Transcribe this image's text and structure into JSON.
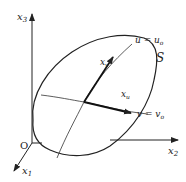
{
  "figure": {
    "type": "surface-parameter-curves",
    "axes": {
      "x1": {
        "label": "x",
        "sub": "1"
      },
      "x2": {
        "label": "x",
        "sub": "2"
      },
      "x3": {
        "label": "x",
        "sub": "3"
      },
      "origin": "O"
    },
    "surface": {
      "label": "S"
    },
    "curves": {
      "u_curve": {
        "label": "u = u",
        "sub": "o"
      },
      "v_curve": {
        "label": "v = v",
        "sub": "o"
      }
    },
    "vectors": {
      "xu": {
        "label": "x",
        "sub": "u"
      },
      "xv": {
        "label": "x",
        "sub": "v"
      }
    },
    "colors": {
      "stroke": "#222222",
      "background": "#ffffff"
    }
  }
}
